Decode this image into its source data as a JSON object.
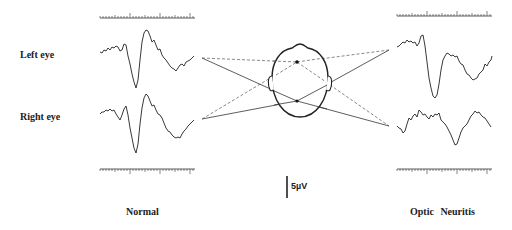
{
  "labels": {
    "left_eye": "Left eye",
    "right_eye": "Right eye",
    "normal": "Normal",
    "optic_neuritis": "Optic Neuritis",
    "scale_bar": "5µV"
  },
  "colors": {
    "ink": "#222222",
    "dashed": "#555555"
  },
  "panels": [
    {
      "name": "normal",
      "caption": "Normal",
      "traces": [
        "left-eye",
        "right-eye"
      ]
    },
    {
      "name": "optic-neuritis",
      "caption": "Optic Neuritis",
      "traces": [
        "left-eye",
        "right-eye"
      ]
    }
  ],
  "scale": {
    "amplitude_label": "5µV"
  }
}
